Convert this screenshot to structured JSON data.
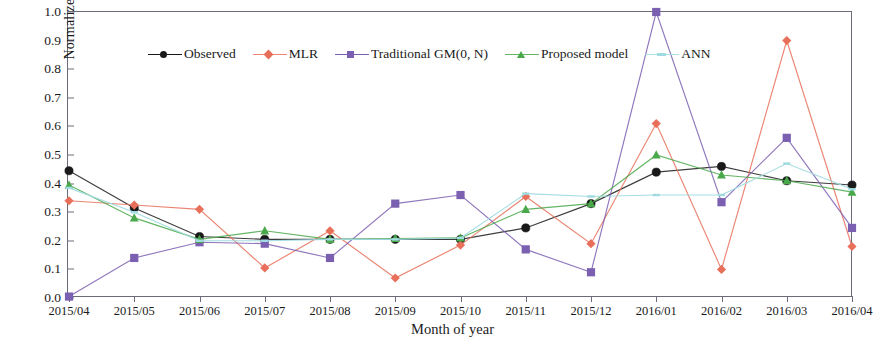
{
  "chart_data": {
    "type": "line",
    "title": "",
    "xlabel": "Month of year",
    "ylabel": "Normalized value",
    "ylim": [
      0.0,
      1.0
    ],
    "ytick_labels": [
      "0.0",
      "0.1",
      "0.2",
      "0.3",
      "0.4",
      "0.5",
      "0.6",
      "0.7",
      "0.8",
      "0.9",
      "1.0"
    ],
    "ytick_values": [
      0.0,
      0.1,
      0.2,
      0.3,
      0.4,
      0.5,
      0.6,
      0.7,
      0.8,
      0.9,
      1.0
    ],
    "grid": false,
    "legend_position": "top-left-inside",
    "categories": [
      "2015/04",
      "2015/05",
      "2015/06",
      "2015/07",
      "2015/08",
      "2015/09",
      "2015/10",
      "2015/11",
      "2015/12",
      "2016/01",
      "2016/02",
      "2016/03",
      "2016/04"
    ],
    "series": [
      {
        "name": "Observed",
        "color": "#1a1a1a",
        "marker": "circle",
        "values": [
          0.445,
          0.315,
          0.215,
          0.205,
          0.205,
          0.205,
          0.205,
          0.245,
          0.33,
          0.44,
          0.46,
          0.41,
          0.395
        ]
      },
      {
        "name": "MLR",
        "color": "#e8705a",
        "marker": "diamond",
        "values": [
          0.34,
          0.325,
          0.31,
          0.105,
          0.235,
          0.07,
          0.185,
          0.355,
          0.19,
          0.61,
          0.1,
          0.9,
          0.18
        ]
      },
      {
        "name": "Traditional GM(0, N)",
        "color": "#7b5fb0",
        "marker": "square",
        "values": [
          0.005,
          0.14,
          0.195,
          0.19,
          0.14,
          0.33,
          0.36,
          0.17,
          0.09,
          1.0,
          0.335,
          0.56,
          0.245
        ]
      },
      {
        "name": "Proposed model",
        "color": "#49a849",
        "marker": "triangle",
        "values": [
          0.395,
          0.28,
          0.205,
          0.235,
          0.205,
          0.208,
          0.21,
          0.31,
          0.33,
          0.5,
          0.43,
          0.41,
          0.37
        ]
      },
      {
        "name": "ANN",
        "color": "#9fdbe0",
        "marker": "line",
        "values": [
          0.385,
          0.3,
          0.2,
          0.2,
          0.205,
          0.205,
          0.21,
          0.365,
          0.355,
          0.36,
          0.36,
          0.47,
          0.38
        ]
      }
    ]
  }
}
